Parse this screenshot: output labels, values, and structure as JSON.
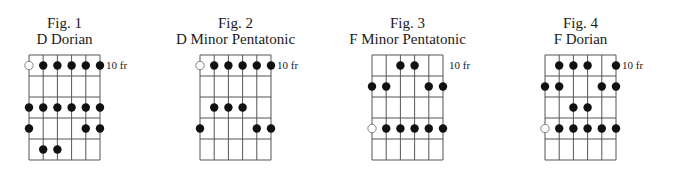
{
  "page": {
    "caption": "Scale fingering diagrams"
  },
  "grid": {
    "strings": 6,
    "frets": 5,
    "string_spacing": 14.2,
    "fret_spacing": 21
  },
  "figures": [
    {
      "fig_label": "Fig. 1",
      "name": "D Dorian",
      "fret_label": "10 fr",
      "fret_label_row": 1,
      "left": 29,
      "notes": [
        {
          "fret": 1,
          "string": 1,
          "type": "open"
        },
        {
          "fret": 1,
          "string": 2,
          "type": "filled"
        },
        {
          "fret": 1,
          "string": 3,
          "type": "filled"
        },
        {
          "fret": 1,
          "string": 4,
          "type": "filled"
        },
        {
          "fret": 1,
          "string": 5,
          "type": "filled"
        },
        {
          "fret": 1,
          "string": 6,
          "type": "filled"
        },
        {
          "fret": 3,
          "string": 1,
          "type": "filled"
        },
        {
          "fret": 3,
          "string": 2,
          "type": "filled"
        },
        {
          "fret": 3,
          "string": 3,
          "type": "filled"
        },
        {
          "fret": 3,
          "string": 4,
          "type": "filled"
        },
        {
          "fret": 3,
          "string": 5,
          "type": "filled"
        },
        {
          "fret": 3,
          "string": 6,
          "type": "filled"
        },
        {
          "fret": 4,
          "string": 1,
          "type": "filled"
        },
        {
          "fret": 4,
          "string": 5,
          "type": "filled"
        },
        {
          "fret": 4,
          "string": 6,
          "type": "filled"
        },
        {
          "fret": 5,
          "string": 2,
          "type": "filled"
        },
        {
          "fret": 5,
          "string": 3,
          "type": "filled"
        }
      ]
    },
    {
      "fig_label": "Fig. 2",
      "name": "D Minor Pentatonic",
      "fret_label": "10 fr",
      "fret_label_row": 1,
      "left": 200,
      "notes": [
        {
          "fret": 1,
          "string": 1,
          "type": "open"
        },
        {
          "fret": 1,
          "string": 2,
          "type": "filled"
        },
        {
          "fret": 1,
          "string": 3,
          "type": "filled"
        },
        {
          "fret": 1,
          "string": 4,
          "type": "filled"
        },
        {
          "fret": 1,
          "string": 5,
          "type": "filled"
        },
        {
          "fret": 1,
          "string": 6,
          "type": "filled"
        },
        {
          "fret": 3,
          "string": 2,
          "type": "filled"
        },
        {
          "fret": 3,
          "string": 3,
          "type": "filled"
        },
        {
          "fret": 3,
          "string": 4,
          "type": "filled"
        },
        {
          "fret": 4,
          "string": 1,
          "type": "filled"
        },
        {
          "fret": 4,
          "string": 5,
          "type": "filled"
        },
        {
          "fret": 4,
          "string": 6,
          "type": "filled"
        }
      ]
    },
    {
      "fig_label": "Fig. 3",
      "name": "F Minor Pentatonic",
      "fret_label": "10 fr",
      "fret_label_row": 1,
      "left": 372,
      "notes": [
        {
          "fret": 1,
          "string": 3,
          "type": "filled"
        },
        {
          "fret": 1,
          "string": 4,
          "type": "filled"
        },
        {
          "fret": 2,
          "string": 1,
          "type": "filled"
        },
        {
          "fret": 2,
          "string": 2,
          "type": "filled"
        },
        {
          "fret": 2,
          "string": 5,
          "type": "filled"
        },
        {
          "fret": 2,
          "string": 6,
          "type": "filled"
        },
        {
          "fret": 4,
          "string": 1,
          "type": "open"
        },
        {
          "fret": 4,
          "string": 2,
          "type": "filled"
        },
        {
          "fret": 4,
          "string": 3,
          "type": "filled"
        },
        {
          "fret": 4,
          "string": 4,
          "type": "filled"
        },
        {
          "fret": 4,
          "string": 5,
          "type": "filled"
        },
        {
          "fret": 4,
          "string": 6,
          "type": "filled"
        }
      ]
    },
    {
      "fig_label": "Fig. 4",
      "name": "F Dorian",
      "fret_label": "10 fr",
      "fret_label_row": 1,
      "left": 545,
      "notes": [
        {
          "fret": 1,
          "string": 2,
          "type": "filled"
        },
        {
          "fret": 1,
          "string": 3,
          "type": "filled"
        },
        {
          "fret": 1,
          "string": 4,
          "type": "filled"
        },
        {
          "fret": 1,
          "string": 6,
          "type": "filled"
        },
        {
          "fret": 2,
          "string": 1,
          "type": "filled"
        },
        {
          "fret": 2,
          "string": 2,
          "type": "filled"
        },
        {
          "fret": 2,
          "string": 5,
          "type": "filled"
        },
        {
          "fret": 2,
          "string": 6,
          "type": "filled"
        },
        {
          "fret": 3,
          "string": 3,
          "type": "filled"
        },
        {
          "fret": 3,
          "string": 4,
          "type": "filled"
        },
        {
          "fret": 4,
          "string": 1,
          "type": "open"
        },
        {
          "fret": 4,
          "string": 2,
          "type": "filled"
        },
        {
          "fret": 4,
          "string": 3,
          "type": "filled"
        },
        {
          "fret": 4,
          "string": 4,
          "type": "filled"
        },
        {
          "fret": 4,
          "string": 5,
          "type": "filled"
        },
        {
          "fret": 4,
          "string": 6,
          "type": "filled"
        }
      ]
    }
  ]
}
